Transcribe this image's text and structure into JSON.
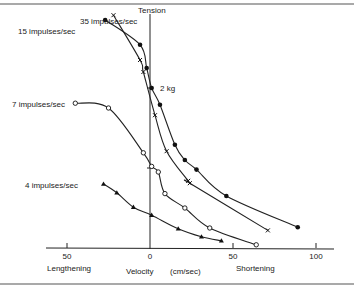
{
  "chart_data": {
    "type": "line",
    "title": "",
    "xlabel": "Velocity (cm/sec)",
    "xlabel_parts": {
      "left": "Lengthening",
      "center": "Velocity",
      "units": "(cm/sec)",
      "right": "Shortening"
    },
    "ylabel": "Tension",
    "y_annotation": "2 kg",
    "y_annotation_value": 2,
    "xticks": [
      -50,
      0,
      50,
      100
    ],
    "xtick_labels": [
      "50",
      "0",
      "50",
      "100"
    ],
    "xlim": [
      -60,
      105
    ],
    "ylim": [
      0,
      2.9
    ],
    "grid": false,
    "series": [
      {
        "name": "35 impulses/sec",
        "marker": "filled-circle",
        "x": [
          -27,
          -6,
          -2,
          1,
          6,
          15,
          21,
          28,
          46,
          89
        ],
        "y": [
          2.85,
          2.54,
          2.25,
          2.0,
          1.79,
          1.29,
          1.1,
          0.98,
          0.65,
          0.26
        ]
      },
      {
        "name": "15 impulses/sec",
        "marker": "cross",
        "x": [
          -22,
          -6,
          -4,
          3,
          10,
          23,
          24,
          71
        ],
        "y": [
          2.91,
          2.35,
          2.2,
          1.66,
          1.21,
          0.84,
          0.81,
          0.22
        ]
      },
      {
        "name": "7 impulses/sec",
        "marker": "open-circle",
        "x": [
          -45,
          -25,
          -4,
          1,
          5,
          9,
          21,
          36,
          64
        ],
        "y": [
          1.81,
          1.75,
          1.19,
          1.02,
          0.95,
          0.68,
          0.5,
          0.25,
          0.04
        ]
      },
      {
        "name": "4 impulses/sec",
        "marker": "filled-triangle",
        "x": [
          -28,
          -20,
          -10,
          1,
          17,
          31,
          43
        ],
        "y": [
          0.8,
          0.69,
          0.51,
          0.41,
          0.24,
          0.14,
          0.09
        ]
      }
    ]
  }
}
